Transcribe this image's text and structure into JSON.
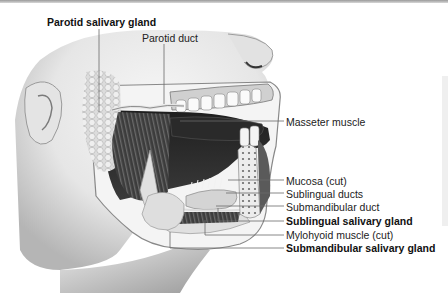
{
  "figure": {
    "style": "grayscale anatomical illustration"
  },
  "labels": {
    "parotid_gland": {
      "text": "Parotid salivary gland",
      "bold": true
    },
    "parotid_duct": {
      "text": "Parotid duct",
      "bold": false
    },
    "masseter": {
      "text": "Masseter muscle",
      "bold": false
    },
    "mucosa": {
      "text": "Mucosa (cut)",
      "bold": false
    },
    "sublingual_ducts": {
      "text": "Sublingual ducts",
      "bold": false
    },
    "submandibular_duct": {
      "text": "Submandibular duct",
      "bold": false
    },
    "sublingual_gland": {
      "text": "Sublingual salivary gland",
      "bold": true
    },
    "mylohyoid": {
      "text": "Mylohyoid muscle (cut)",
      "bold": false
    },
    "submandibular_gland": {
      "text": "Submandibular salivary gland",
      "bold": true
    }
  },
  "colors": {
    "skin_light": "#f2f2f2",
    "skin_shadow": "#9a9a9a",
    "cavity_dark": "#2a2a2a",
    "muscle": "#4a4a4a",
    "gland": "#d9d9d9",
    "leader_line": "#6a6a6a",
    "label_text": "#222222"
  }
}
